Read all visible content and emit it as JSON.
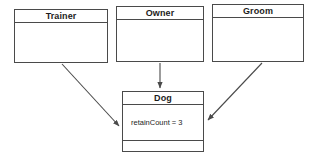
{
  "diagram": {
    "type": "uml-class-diagram",
    "background_color": "#ffffff",
    "line_color": "#4a4a4a",
    "text_color": "#1c1c1c",
    "classes": [
      {
        "id": "trainer",
        "name": "Trainer",
        "attributes": [],
        "operations": []
      },
      {
        "id": "owner",
        "name": "Owner",
        "attributes": [],
        "operations": []
      },
      {
        "id": "groom",
        "name": "Groom",
        "attributes": [],
        "operations": []
      },
      {
        "id": "dog",
        "name": "Dog",
        "attributes": [
          "retainCount = 3"
        ],
        "operations": []
      }
    ],
    "relationships": [
      {
        "id": "trainer-to-dog",
        "from": "Trainer",
        "to": "Dog",
        "style": "arrow"
      },
      {
        "id": "owner-to-dog",
        "from": "Owner",
        "to": "Dog",
        "style": "arrow"
      },
      {
        "id": "groom-to-dog",
        "from": "Groom",
        "to": "Dog",
        "style": "arrow"
      }
    ]
  }
}
